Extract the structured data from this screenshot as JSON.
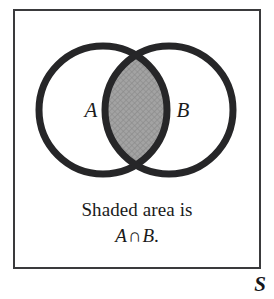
{
  "figure": {
    "name": "venn-diagram-intersection",
    "background_color": "#ffffff"
  },
  "frame": {
    "border_color": "#3a3a3c",
    "border_width_px": 2
  },
  "diagram": {
    "type": "venn-two-set",
    "stroke_color": "#262628",
    "stroke_width_px": 7,
    "circle_fill": "#ffffff",
    "shaded_region": "intersection",
    "shaded_fill_color": "#9d9d9d",
    "shaded_texture": "crosshatch",
    "left_circle": {
      "label": "A",
      "center_x": 90,
      "center_y": 101,
      "radius": 64
    },
    "right_circle": {
      "label": "B",
      "center_x": 156,
      "center_y": 101,
      "radius": 64
    },
    "label_a": "A",
    "label_b": "B"
  },
  "caption": {
    "line1": "Shaded area is",
    "line2_var_a": "A",
    "line2_operator": "∩",
    "line2_var_b": "B",
    "line2_period": "."
  },
  "corner_marker": {
    "text": "S"
  }
}
